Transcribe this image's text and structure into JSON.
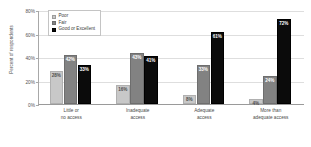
{
  "chart_data": {
    "type": "bar",
    "title": "",
    "subtitle": "",
    "xlabel": "",
    "ylabel": "Percent of respondents",
    "ylim": [
      0,
      80
    ],
    "ytick_labels": [
      "0%",
      "20%",
      "40%",
      "60%",
      "80%"
    ],
    "ytick_values": [
      0,
      20,
      40,
      60,
      80
    ],
    "grid": true,
    "legend_position": "top-left-inside",
    "categories": [
      "Little or\nno access",
      "Inadequate\naccess",
      "Adequate\naccess",
      "More than\nadequate access"
    ],
    "series": [
      {
        "name": "Poor",
        "color": "#c8c8c8",
        "values": [
          28,
          16,
          8,
          4
        ],
        "value_labels": [
          "28%",
          "16%",
          "8%",
          "4%"
        ]
      },
      {
        "name": "Fair",
        "color": "#828282",
        "values": [
          42,
          43,
          33,
          24
        ],
        "value_labels": [
          "42%",
          "43%",
          "33%",
          "24%"
        ]
      },
      {
        "name": "Good or Excellent",
        "color": "#0b0b0b",
        "values": [
          33,
          41,
          61,
          72
        ],
        "value_labels": [
          "33%",
          "41%",
          "61%",
          "72%"
        ]
      }
    ]
  },
  "legend": {
    "items": [
      {
        "label": "Poor"
      },
      {
        "label": "Fair"
      },
      {
        "label": "Good or Excellent"
      }
    ]
  },
  "axes": {
    "y_title": "Percent of respondents",
    "y_ticks": [
      {
        "label": "80%"
      },
      {
        "label": "60%"
      },
      {
        "label": "40%"
      },
      {
        "label": "20%"
      },
      {
        "label": "0%"
      }
    ],
    "x_categories": [
      {
        "label": "Little or\nno access"
      },
      {
        "label": "Inadequate\naccess"
      },
      {
        "label": "Adequate\naccess"
      },
      {
        "label": "More than\nadequate access"
      }
    ]
  }
}
